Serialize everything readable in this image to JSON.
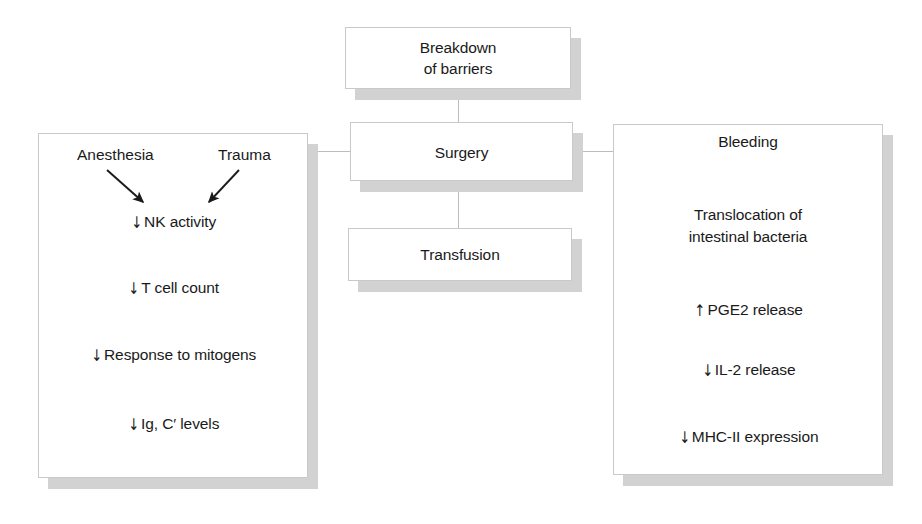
{
  "diagram": {
    "colors": {
      "box_fill": "#ffffff",
      "box_border": "#c9c9c9",
      "shadow": "#d2d2d2",
      "connector": "#bcbcbc",
      "text": "#1a1a1a"
    },
    "center_boxes": [
      {
        "id": "breakdown",
        "label_line1": "Breakdown",
        "label_line2": "of barriers"
      },
      {
        "id": "surgery",
        "label": "Surgery"
      },
      {
        "id": "transfusion",
        "label": "Transfusion"
      }
    ],
    "left_panel": {
      "heads": [
        {
          "label": "Anesthesia"
        },
        {
          "label": "Trauma"
        }
      ],
      "arrows": [
        {
          "from": "Anesthesia",
          "direction": "down-right"
        },
        {
          "from": "Trauma",
          "direction": "down-left"
        }
      ],
      "items": [
        {
          "arrow": "↓",
          "label": "NK activity"
        },
        {
          "arrow": "↓",
          "label": "T cell count"
        },
        {
          "arrow": "↓",
          "label": "Response to mitogens"
        },
        {
          "arrow": "↓",
          "label": "Ig, C′ levels"
        }
      ]
    },
    "right_panel": {
      "heading": "Bleeding",
      "subheading_line1": "Translocation of",
      "subheading_line2": "intestinal bacteria",
      "items": [
        {
          "arrow": "↑",
          "label": "PGE2 release"
        },
        {
          "arrow": "↓",
          "label": "IL-2 release"
        },
        {
          "arrow": "↓",
          "label": "MHC-II expression"
        }
      ]
    },
    "connectors": [
      {
        "id": "breakdown-surgery",
        "orientation": "vertical"
      },
      {
        "id": "surgery-transfusion",
        "orientation": "vertical"
      },
      {
        "id": "left-panel-surgery",
        "orientation": "horizontal"
      },
      {
        "id": "surgery-right-panel",
        "orientation": "horizontal"
      }
    ]
  }
}
